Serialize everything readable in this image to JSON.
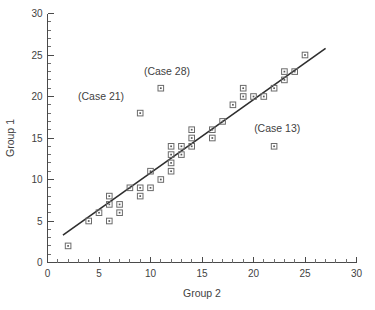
{
  "chart_data": {
    "type": "scatter",
    "title": "",
    "xlabel": "Group 2",
    "ylabel": "Group 1",
    "xlim": [
      0,
      30
    ],
    "ylim": [
      0,
      30
    ],
    "xticks": [
      0,
      5,
      10,
      15,
      20,
      25,
      30
    ],
    "yticks": [
      0,
      5,
      10,
      15,
      20,
      25,
      30
    ],
    "xtick_labels": [
      "0",
      "5",
      "10",
      "15",
      "20",
      "25",
      "30"
    ],
    "ytick_labels": [
      "0",
      "5",
      "10",
      "15",
      "20",
      "25",
      "30"
    ],
    "minor_tick_step": 1,
    "grid": false,
    "legend": "none",
    "marker": "open-square-with-center-dot",
    "marker_color": "#6b6b6b",
    "line_color": "#2e2e2e",
    "points": [
      {
        "x": 2,
        "y": 2
      },
      {
        "x": 4,
        "y": 5
      },
      {
        "x": 5,
        "y": 6
      },
      {
        "x": 6,
        "y": 5
      },
      {
        "x": 6,
        "y": 7
      },
      {
        "x": 6,
        "y": 8
      },
      {
        "x": 7,
        "y": 6
      },
      {
        "x": 7,
        "y": 7
      },
      {
        "x": 8,
        "y": 9
      },
      {
        "x": 9,
        "y": 8
      },
      {
        "x": 9,
        "y": 9
      },
      {
        "x": 9,
        "y": 18
      },
      {
        "x": 10,
        "y": 9
      },
      {
        "x": 10,
        "y": 11
      },
      {
        "x": 11,
        "y": 10
      },
      {
        "x": 11,
        "y": 21
      },
      {
        "x": 12,
        "y": 11
      },
      {
        "x": 12,
        "y": 12
      },
      {
        "x": 12,
        "y": 13
      },
      {
        "x": 12,
        "y": 14
      },
      {
        "x": 13,
        "y": 13
      },
      {
        "x": 13,
        "y": 14
      },
      {
        "x": 14,
        "y": 14
      },
      {
        "x": 14,
        "y": 15
      },
      {
        "x": 14,
        "y": 16
      },
      {
        "x": 16,
        "y": 15
      },
      {
        "x": 16,
        "y": 16
      },
      {
        "x": 17,
        "y": 17
      },
      {
        "x": 18,
        "y": 19
      },
      {
        "x": 19,
        "y": 20
      },
      {
        "x": 19,
        "y": 21
      },
      {
        "x": 20,
        "y": 20
      },
      {
        "x": 21,
        "y": 20
      },
      {
        "x": 22,
        "y": 14
      },
      {
        "x": 22,
        "y": 21
      },
      {
        "x": 23,
        "y": 22
      },
      {
        "x": 23,
        "y": 23
      },
      {
        "x": 24,
        "y": 23
      },
      {
        "x": 25,
        "y": 25
      }
    ],
    "fit_line": {
      "x_start": 1.5,
      "y_start": 3.3,
      "x_end": 27.0,
      "y_end": 25.8
    },
    "annotations": [
      {
        "text": "(Case 21)",
        "x": 5.2,
        "y": 19.6
      },
      {
        "text": "(Case 28)",
        "x": 11.6,
        "y": 22.6
      },
      {
        "text": "(Case 13)",
        "x": 22.3,
        "y": 15.7
      }
    ]
  }
}
